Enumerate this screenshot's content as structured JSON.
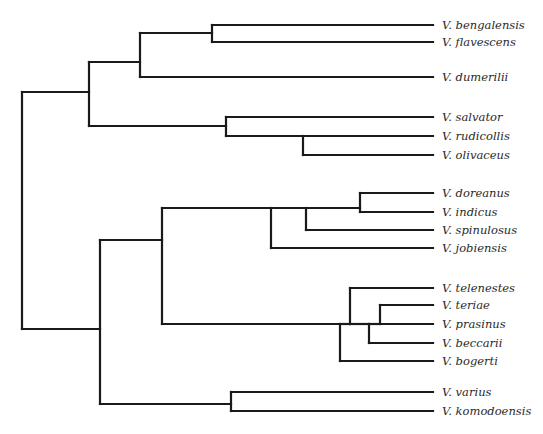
{
  "diagram": {
    "type": "phylogenetic-tree",
    "line_color": "#1a1a1a",
    "tip_x": 433,
    "taxa": [
      {
        "label": "V. bengalensis",
        "y": 25
      },
      {
        "label": "V. flavescens",
        "y": 42
      },
      {
        "label": "V. dumerilii",
        "y": 77
      },
      {
        "label": "V. salvator",
        "y": 117
      },
      {
        "label": "V. rudicollis",
        "y": 136
      },
      {
        "label": "V. olivaceus",
        "y": 155
      },
      {
        "label": "V. doreanus",
        "y": 193
      },
      {
        "label": "V. indicus",
        "y": 212
      },
      {
        "label": "V. spinulosus",
        "y": 230
      },
      {
        "label": "V. jobiensis",
        "y": 248
      },
      {
        "label": "V. telenestes",
        "y": 288
      },
      {
        "label": "V. teriae",
        "y": 305
      },
      {
        "label": "V. prasinus",
        "y": 324
      },
      {
        "label": "V. beccarii",
        "y": 343
      },
      {
        "label": "V. bogerti",
        "y": 361
      },
      {
        "label": "V. varius",
        "y": 392
      },
      {
        "label": "V. komodoensis",
        "y": 411
      }
    ],
    "segments": [
      [
        22,
        92,
        22,
        329
      ],
      [
        22,
        92,
        89,
        92
      ],
      [
        22,
        329,
        100,
        329
      ],
      [
        89,
        62,
        89,
        126
      ],
      [
        89,
        62,
        140,
        62
      ],
      [
        140,
        33,
        140,
        77
      ],
      [
        140,
        33,
        212,
        33
      ],
      [
        212,
        25,
        212,
        42
      ],
      [
        212,
        25,
        433,
        25
      ],
      [
        212,
        42,
        433,
        42
      ],
      [
        140,
        77,
        433,
        77
      ],
      [
        89,
        126,
        226,
        126
      ],
      [
        226,
        117,
        226,
        136
      ],
      [
        226,
        117,
        433,
        117
      ],
      [
        226,
        136,
        303,
        136
      ],
      [
        303,
        136,
        303,
        155
      ],
      [
        303,
        136,
        433,
        136
      ],
      [
        303,
        155,
        433,
        155
      ],
      [
        100,
        240,
        100,
        404
      ],
      [
        100,
        240,
        162,
        240
      ],
      [
        162,
        208,
        162,
        324
      ],
      [
        162,
        208,
        271,
        208
      ],
      [
        271,
        208,
        271,
        248
      ],
      [
        271,
        208,
        306,
        208
      ],
      [
        306,
        208,
        306,
        230
      ],
      [
        306,
        208,
        360,
        208
      ],
      [
        360,
        193,
        360,
        212
      ],
      [
        360,
        193,
        433,
        193
      ],
      [
        360,
        212,
        433,
        212
      ],
      [
        306,
        230,
        433,
        230
      ],
      [
        271,
        248,
        433,
        248
      ],
      [
        162,
        324,
        340,
        324
      ],
      [
        340,
        324,
        340,
        361
      ],
      [
        340,
        324,
        350,
        324
      ],
      [
        350,
        288,
        350,
        324
      ],
      [
        350,
        288,
        433,
        288
      ],
      [
        350,
        324,
        369,
        324
      ],
      [
        369,
        324,
        369,
        343
      ],
      [
        369,
        324,
        380,
        324
      ],
      [
        380,
        305,
        380,
        324
      ],
      [
        380,
        305,
        433,
        305
      ],
      [
        380,
        324,
        433,
        324
      ],
      [
        369,
        343,
        433,
        343
      ],
      [
        340,
        361,
        433,
        361
      ],
      [
        100,
        404,
        231,
        404
      ],
      [
        231,
        392,
        231,
        411
      ],
      [
        231,
        392,
        433,
        392
      ],
      [
        231,
        411,
        433,
        411
      ]
    ]
  }
}
